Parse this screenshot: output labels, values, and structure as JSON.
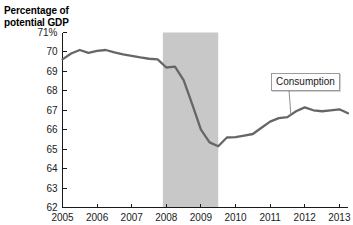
{
  "chart_data": {
    "type": "line",
    "xlabel": "",
    "ylabel": "Percentage of potential GDP",
    "xlim": [
      2005.0,
      2013.25
    ],
    "ylim": [
      62,
      71
    ],
    "grid": false,
    "legend_position": "inline-callout",
    "y_ticks": [
      "71%",
      "70",
      "69",
      "68",
      "67",
      "66",
      "65",
      "64",
      "63",
      "62"
    ],
    "y_tick_values": [
      71,
      70,
      69,
      68,
      67,
      66,
      65,
      64,
      63,
      62
    ],
    "x_ticks": [
      "2005",
      "2006",
      "2007",
      "2008",
      "2009",
      "2010",
      "2011",
      "2012",
      "2013"
    ],
    "x_tick_values": [
      2005,
      2006,
      2007,
      2008,
      2009,
      2010,
      2011,
      2012,
      2013
    ],
    "annotations": [
      {
        "text": "Consumption",
        "type": "callout-box",
        "points_to_x": 2011.6,
        "points_to_y": 66.75
      }
    ],
    "shaded_regions": [
      {
        "name": "recession",
        "x_start": 2007.9,
        "x_end": 2009.5,
        "color": "#c8c8c8"
      }
    ],
    "series": [
      {
        "name": "Consumption",
        "color": "#666666",
        "x": [
          2005.0,
          2005.25,
          2005.5,
          2005.75,
          2006.0,
          2006.25,
          2006.5,
          2006.75,
          2007.0,
          2007.25,
          2007.5,
          2007.75,
          2008.0,
          2008.25,
          2008.5,
          2008.75,
          2009.0,
          2009.25,
          2009.5,
          2009.75,
          2010.0,
          2010.25,
          2010.5,
          2010.75,
          2011.0,
          2011.25,
          2011.5,
          2011.75,
          2012.0,
          2012.25,
          2012.5,
          2012.75,
          2013.0,
          2013.25
        ],
        "values": [
          69.62,
          69.92,
          70.1,
          69.95,
          70.05,
          70.1,
          69.98,
          69.88,
          69.8,
          69.72,
          69.65,
          69.62,
          69.2,
          69.25,
          68.55,
          67.3,
          66.0,
          65.35,
          65.15,
          65.6,
          65.62,
          65.7,
          65.78,
          66.1,
          66.42,
          66.6,
          66.65,
          66.95,
          67.15,
          67.0,
          66.95,
          67.0,
          67.05,
          66.85
        ]
      }
    ]
  },
  "labels": {
    "axis_title_line1": "Percentage of",
    "axis_title_line2": "potential GDP",
    "callout_consumption": "Consumption"
  }
}
